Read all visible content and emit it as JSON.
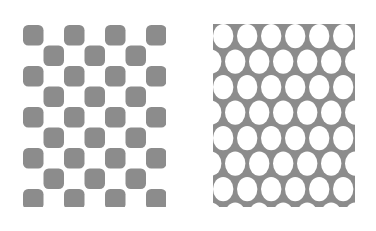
{
  "figure": {
    "caption": "",
    "background_color": "#ffffff",
    "width": 376,
    "height": 231
  },
  "panels": [
    {
      "id": "checkerboard",
      "name": "Checkerboard pattern panel",
      "pattern_type": "checkerboard",
      "description": "Square lattice of rounded-corner tiles in alternating gray and white",
      "fill_color": "#8c8c8c",
      "background_color": "#ffffff",
      "x": 23,
      "y": 25,
      "width": 143,
      "height": 182,
      "columns": 7,
      "rows": 9,
      "cell_pitch_x": 20.5,
      "cell_pitch_y": 20.5,
      "tile_size": 20.5,
      "corner_radius": 5.2,
      "parity_offset": 0
    },
    {
      "id": "ellipse-grid",
      "name": "Staggered ellipse pattern panel",
      "pattern_type": "staggered-ellipse-grid",
      "description": "Offset rows of white ellipses on a gray field",
      "fill_color": "#8c8c8c",
      "hole_color": "#ffffff",
      "x": 213,
      "y": 24,
      "width": 142,
      "height": 183,
      "columns": 6,
      "rows": 8,
      "cell_pitch_x": 24.0,
      "cell_pitch_y": 25.5,
      "row_offset_x": 12.0,
      "ellipse_rx": 10.2,
      "ellipse_ry": 12.1
    }
  ],
  "colors": {
    "gray": "#8c8c8c",
    "white": "#ffffff"
  }
}
